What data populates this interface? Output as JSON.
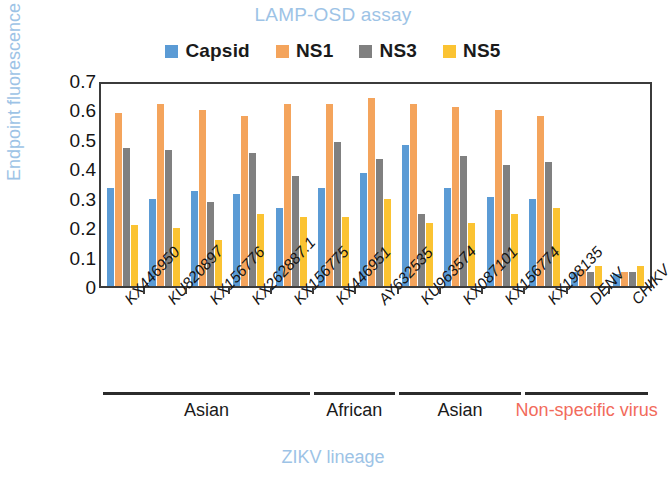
{
  "chart_data": {
    "type": "bar",
    "title": "LAMP-OSD assay",
    "xlabel": "ZIKV lineage",
    "ylabel": "Endpoint fluorescence",
    "ylim": [
      0,
      0.7
    ],
    "ytick_labels": [
      "0.7",
      "0.6",
      "0.5",
      "0.4",
      "0.3",
      "0.2",
      "0.1",
      "0"
    ],
    "ytick_values": [
      0.7,
      0.6,
      0.5,
      0.4,
      0.3,
      0.2,
      0.1,
      0
    ],
    "grid": false,
    "legend_position": "top-center",
    "categories": [
      "KX446950",
      "KU820897",
      "KX156776",
      "KX262887.1",
      "KX156775",
      "KX446951",
      "AY632535",
      "KU963574",
      "KX087101",
      "KX156774",
      "KX198135",
      "DENV",
      "CHIKV"
    ],
    "series": [
      {
        "name": "Capsid",
        "color": "#5b9bd5",
        "values": [
          0.34,
          0.3,
          0.33,
          0.32,
          0.27,
          0.34,
          0.39,
          0.49,
          0.34,
          0.31,
          0.3,
          0.05,
          0.04
        ]
      },
      {
        "name": "NS1",
        "color": "#f4a45c",
        "values": [
          0.6,
          0.63,
          0.61,
          0.59,
          0.63,
          0.63,
          0.65,
          0.63,
          0.62,
          0.61,
          0.59,
          0.06,
          0.05
        ]
      },
      {
        "name": "NS3",
        "color": "#808080",
        "values": [
          0.48,
          0.47,
          0.29,
          0.46,
          0.38,
          0.5,
          0.44,
          0.25,
          0.45,
          0.42,
          0.43,
          0.05,
          0.05
        ]
      },
      {
        "name": "NS5",
        "color": "#fbc332",
        "values": [
          0.21,
          0.2,
          0.16,
          0.25,
          0.24,
          0.24,
          0.3,
          0.22,
          0.22,
          0.25,
          0.27,
          0.07,
          0.07
        ]
      }
    ],
    "groups": [
      {
        "label": "Asian",
        "start": 0,
        "end": 4
      },
      {
        "label": "African",
        "start": 5,
        "end": 6
      },
      {
        "label": "Asian",
        "start": 7,
        "end": 9
      },
      {
        "label": "Non-specific virus",
        "start": 10,
        "end": 12
      }
    ]
  },
  "colors": {
    "title": "#9dc3e6",
    "axis_title": "#9dc3e6",
    "nonspecific": "#f26b5b",
    "axis": "#3b3b3b"
  }
}
